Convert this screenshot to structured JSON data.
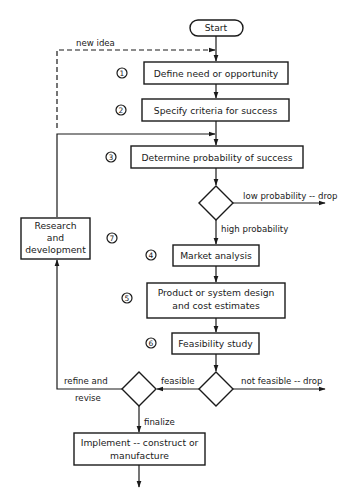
{
  "diagram": {
    "type": "flowchart",
    "colors": {
      "stroke": "#1a1a1a",
      "background": "#ffffff"
    },
    "start": {
      "label": "Start"
    },
    "steps": [
      {
        "number": "1",
        "label": "Define need or opportunity"
      },
      {
        "number": "2",
        "label": "Specify criteria for success"
      },
      {
        "number": "3",
        "label": "Determine probability of success"
      },
      {
        "number": "4",
        "label": "Market analysis"
      },
      {
        "number": "5",
        "label_line1": "Product or system design",
        "label_line2": "and cost estimates"
      },
      {
        "number": "6",
        "label": "Feasibility study"
      },
      {
        "number": "7",
        "label_line1": "Research",
        "label_line2": "and",
        "label_line3": "development"
      },
      {
        "label_line1": "Implement -- construct or",
        "label_line2": "manufacture"
      }
    ],
    "edges": {
      "new_idea": "new idea",
      "low_probability": "low probability -- drop",
      "high_probability": "high probability",
      "not_feasible": "not feasible -- drop",
      "feasible": "feasible",
      "refine_line1": "refine and",
      "refine_line2": "revise",
      "finalize": "finalize"
    }
  }
}
